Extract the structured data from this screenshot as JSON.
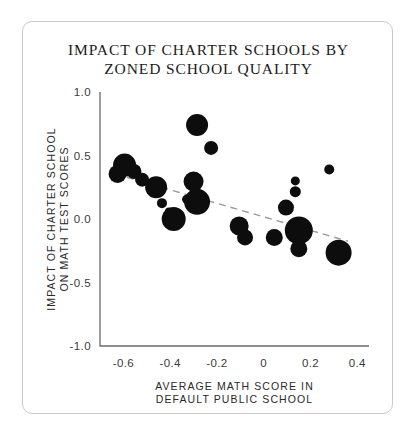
{
  "card": {
    "title_line1": "IMPACT OF CHARTER SCHOOLS BY",
    "title_line2": "ZONED SCHOOL QUALITY"
  },
  "chart_data": {
    "type": "scatter",
    "title": "IMPACT OF CHARTER SCHOOLS BY ZONED SCHOOL QUALITY",
    "xlabel": "AVERAGE MATH SCORE IN DEFAULT PUBLIC SCHOOL",
    "xlabel_line1": "AVERAGE MATH SCORE IN",
    "xlabel_line2": "DEFAULT PUBLIC SCHOOL",
    "ylabel": "IMPACT OF CHARTER SCHOOL ON MATH TEST SCORES",
    "ylabel_line1": "IMPACT OF CHARTER SCHOOL",
    "ylabel_line2": "ON MATH TEST SCORES",
    "xlim": [
      -0.7,
      0.45
    ],
    "ylim": [
      -1.0,
      1.0
    ],
    "xticks": [
      -0.6,
      -0.4,
      -0.2,
      0,
      0.2,
      0.4
    ],
    "xtick_labels": [
      "-0.6",
      "-0.4",
      "-0.2",
      "0",
      "0.2",
      "0.4"
    ],
    "yticks": [
      1.0,
      0.5,
      0.0,
      -0.5,
      -1.0
    ],
    "ytick_labels": [
      "1.0",
      "0.5",
      "0.0",
      "-0.5",
      "-1.0"
    ],
    "grid": false,
    "legend": null,
    "marker_color": "#0d0d0d",
    "size_encodes": "enrollment weight",
    "points": [
      {
        "x": -0.625,
        "y": 0.355,
        "size": 9.0
      },
      {
        "x": -0.595,
        "y": 0.425,
        "size": 11.5
      },
      {
        "x": -0.555,
        "y": 0.375,
        "size": 7.5
      },
      {
        "x": -0.52,
        "y": 0.31,
        "size": 7.0
      },
      {
        "x": -0.46,
        "y": 0.25,
        "size": 11.0
      },
      {
        "x": -0.435,
        "y": 0.125,
        "size": 5.0
      },
      {
        "x": -0.405,
        "y": 0.06,
        "size": 4.0
      },
      {
        "x": -0.385,
        "y": 0.0,
        "size": 12.0
      },
      {
        "x": -0.33,
        "y": 0.155,
        "size": 4.5
      },
      {
        "x": -0.3,
        "y": 0.295,
        "size": 10.0
      },
      {
        "x": -0.285,
        "y": 0.74,
        "size": 11.0
      },
      {
        "x": -0.285,
        "y": 0.135,
        "size": 13.0
      },
      {
        "x": -0.225,
        "y": 0.56,
        "size": 7.0
      },
      {
        "x": -0.105,
        "y": -0.055,
        "size": 9.5
      },
      {
        "x": -0.08,
        "y": -0.145,
        "size": 8.0
      },
      {
        "x": 0.045,
        "y": -0.145,
        "size": 8.5
      },
      {
        "x": 0.095,
        "y": 0.09,
        "size": 8.0
      },
      {
        "x": 0.135,
        "y": 0.3,
        "size": 4.5
      },
      {
        "x": 0.135,
        "y": 0.215,
        "size": 5.5
      },
      {
        "x": 0.15,
        "y": -0.09,
        "size": 14.0
      },
      {
        "x": 0.15,
        "y": -0.235,
        "size": 8.5
      },
      {
        "x": 0.28,
        "y": 0.39,
        "size": 5.0
      },
      {
        "x": 0.32,
        "y": -0.265,
        "size": 13.0
      }
    ],
    "trendline": {
      "style": "dashed",
      "color": "#9a9a9a",
      "x0": -0.635,
      "y0": 0.355,
      "x1": 0.36,
      "y1": -0.175
    }
  }
}
